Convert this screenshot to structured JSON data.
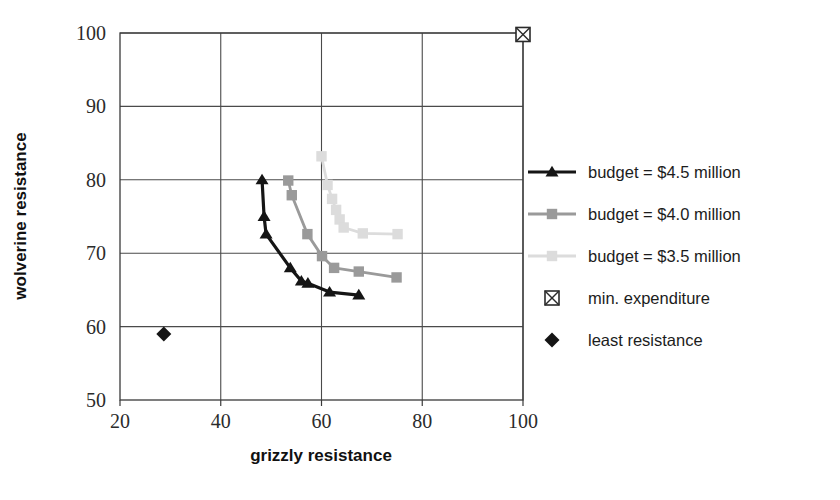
{
  "chart_data": {
    "type": "scatter",
    "title": "",
    "xlabel": "grizzly resistance",
    "ylabel": "wolverine resistance",
    "xlim": [
      20,
      100
    ],
    "ylim": [
      50,
      100
    ],
    "xticks": [
      20,
      40,
      60,
      80,
      100
    ],
    "yticks": [
      50,
      60,
      70,
      80,
      90,
      100
    ],
    "grid": true,
    "legend_position": "right",
    "series": [
      {
        "name": "budget = $4.5 million",
        "marker": "triangle",
        "color": "#151515",
        "line": true,
        "points": [
          [
            48.2,
            80.0
          ],
          [
            48.6,
            75.0
          ],
          [
            49.0,
            72.6
          ],
          [
            53.8,
            68.0
          ],
          [
            56.0,
            66.2
          ],
          [
            57.3,
            65.9
          ],
          [
            61.6,
            64.7
          ],
          [
            67.4,
            64.3
          ]
        ]
      },
      {
        "name": "budget = $4.0 million",
        "marker": "square",
        "color": "#9a9a9a",
        "line": true,
        "points": [
          [
            53.4,
            79.9
          ],
          [
            54.1,
            77.9
          ],
          [
            57.2,
            72.6
          ],
          [
            60.1,
            69.6
          ],
          [
            62.5,
            68.0
          ],
          [
            67.4,
            67.5
          ],
          [
            74.9,
            66.7
          ]
        ]
      },
      {
        "name": "budget = $3.5 million",
        "marker": "square",
        "color": "#dcdcdc",
        "line": true,
        "points": [
          [
            60.0,
            83.2
          ],
          [
            61.2,
            79.3
          ],
          [
            62.1,
            77.4
          ],
          [
            62.9,
            75.9
          ],
          [
            63.6,
            74.6
          ],
          [
            64.4,
            73.5
          ],
          [
            68.2,
            72.7
          ],
          [
            75.1,
            72.6
          ]
        ]
      }
    ],
    "markers": [
      {
        "name": "min. expenditure",
        "marker": "crossed-square",
        "color": "#2b2b2b",
        "point": [
          100.0,
          99.8
        ]
      },
      {
        "name": "least resistance",
        "marker": "diamond",
        "color": "#151515",
        "point": [
          28.7,
          59.0
        ]
      }
    ]
  },
  "legend": {
    "items": [
      {
        "label": "budget = $4.5 million",
        "style": "line-triangle",
        "color": "#151515"
      },
      {
        "label": "budget = $4.0 million",
        "style": "line-square",
        "color": "#9a9a9a"
      },
      {
        "label": "budget = $3.5 million",
        "style": "line-square",
        "color": "#dcdcdc"
      },
      {
        "label": "min. expenditure",
        "style": "crossed-square",
        "color": "#2b2b2b"
      },
      {
        "label": "least resistance",
        "style": "diamond",
        "color": "#151515"
      }
    ]
  },
  "axes": {
    "x_title": "grizzly resistance",
    "y_title": "wolverine resistance",
    "x_tick_labels": [
      "20",
      "40",
      "60",
      "80",
      "100"
    ],
    "y_tick_labels": [
      "50",
      "60",
      "70",
      "80",
      "90",
      "100"
    ]
  }
}
